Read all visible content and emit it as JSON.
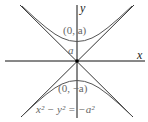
{
  "diagram": {
    "type": "hyperbola",
    "equation": "x² − y² = −a²",
    "axes": {
      "x_label": "x",
      "y_label": "y"
    },
    "labels": {
      "vertex_top": "(0, a)",
      "vertex_bottom": "(0, −a)",
      "a_marker": "a",
      "equation": "x² − y² = −a²"
    },
    "elements": [
      "x-axis",
      "y-axis",
      "asymptote y=x",
      "asymptote y=−x",
      "upper branch",
      "lower branch",
      "origin point"
    ],
    "colors": {
      "curve": "#555555",
      "axis": "#111111",
      "text": "#222222"
    }
  }
}
